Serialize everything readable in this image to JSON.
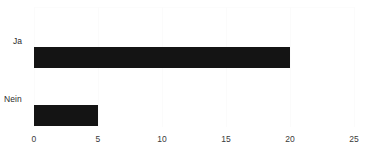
{
  "chart_data": {
    "type": "bar",
    "orientation": "horizontal",
    "title": "",
    "subtitle": "",
    "xlabel": "",
    "ylabel": "",
    "categories": [
      "Ja",
      "Nein"
    ],
    "values": [
      20,
      5
    ],
    "series": [
      {
        "name": "",
        "values": [
          20,
          5
        ]
      }
    ],
    "xlim": [
      0,
      25
    ],
    "xticks": [
      0,
      5,
      10,
      15,
      20,
      25
    ],
    "xtick_labels": [
      "0",
      "5",
      "10",
      "15",
      "20",
      "25"
    ],
    "grid": true,
    "grid_axis": "x",
    "legend": false,
    "legend_position": "none",
    "bar_color": "#141414",
    "grid_color": "#fbfbfb",
    "background_color": "#ffffff",
    "text_color": "#2b2b2b",
    "annotations": []
  },
  "axis": {
    "ticks": [
      {
        "label": "0",
        "value": 0
      },
      {
        "label": "5",
        "value": 5
      },
      {
        "label": "10",
        "value": 10
      },
      {
        "label": "15",
        "value": 15
      },
      {
        "label": "20",
        "value": 20
      },
      {
        "label": "25",
        "value": 25
      }
    ]
  },
  "bars": [
    {
      "label": "Ja",
      "value": 20
    },
    {
      "label": "Nein",
      "value": 5
    }
  ]
}
